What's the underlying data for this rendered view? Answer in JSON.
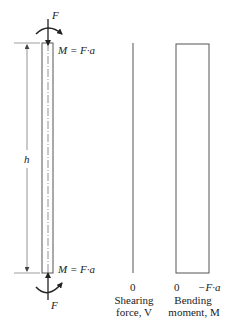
{
  "diagram": {
    "beam": {
      "top_force_label": "F",
      "bottom_force_label": "F",
      "top_moment_label": "M = F·a",
      "bottom_moment_label": "M = F·a",
      "length_label": "h"
    },
    "shear_diagram": {
      "zero_label": "0",
      "caption_line1": "Shearing",
      "caption_line2": "force, V"
    },
    "moment_diagram": {
      "zero_label": "0",
      "value_label": "−F·a",
      "caption_line1": "Bending",
      "caption_line2": "moment, M"
    },
    "colors": {
      "line": "#555555",
      "text": "#222222"
    }
  }
}
